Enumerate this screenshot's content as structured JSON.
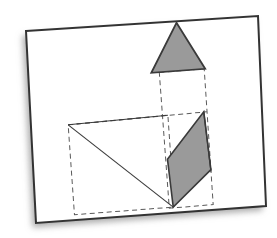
{
  "scene": {
    "title": "Geometric construction figure",
    "width": 277,
    "height": 238,
    "background_color": "#ffffff"
  },
  "card": {
    "name": "paper-card",
    "fill_color": "#ffffff",
    "border_color": "#333333",
    "border_width": 2,
    "rotation_deg": -2.1,
    "shadow_color": "#b9b9b9",
    "corners": [
      [
        26,
        31
      ],
      [
        258,
        16
      ],
      [
        266,
        206
      ],
      [
        36,
        223
      ]
    ]
  },
  "colors": {
    "shape_fill": "#999999",
    "shape_stroke": "#3a3a3a",
    "construction_line": "#555555",
    "solid_line": "#3a3a3a"
  },
  "shapes": {
    "triangle": {
      "label": "gray-triangle",
      "fill": "#9a9a9a",
      "stroke": "#3a3a3a",
      "points": [
        [
          180,
          24
        ],
        [
          207,
          71
        ],
        [
          153,
          73
        ]
      ]
    },
    "parallelogram": {
      "label": "gray-parallelogram",
      "fill": "#9a9a9a",
      "stroke": "#3a3a3a",
      "points": [
        [
          204,
          114
        ],
        [
          209,
          172
        ],
        [
          170,
          208
        ],
        [
          166,
          160
        ]
      ]
    }
  },
  "construction": {
    "tall_rectangle": {
      "label": "dashed-tall-rectangle",
      "points": [
        [
          161,
          73
        ],
        [
          206,
          71
        ],
        [
          210,
          207
        ],
        [
          166,
          209
        ]
      ]
    },
    "square": {
      "label": "dashed-square",
      "points": [
        [
          68,
          122
        ],
        [
          168,
          116
        ],
        [
          171,
          208
        ],
        [
          71,
          212
        ]
      ]
    },
    "mid_horizontal": {
      "label": "dashed-mid-horizontal",
      "from": [
        68,
        122
      ],
      "to": [
        207,
        114
      ]
    }
  },
  "solid_lines": [
    {
      "label": "square-diagonal",
      "from": [
        68,
        122
      ],
      "to": [
        170,
        208
      ]
    },
    {
      "label": "upper-right-diagonal",
      "from": [
        166,
        160
      ],
      "to": [
        204,
        114
      ]
    },
    {
      "label": "lower-right-diagonal",
      "from": [
        170,
        208
      ],
      "to": [
        209,
        172
      ]
    }
  ]
}
